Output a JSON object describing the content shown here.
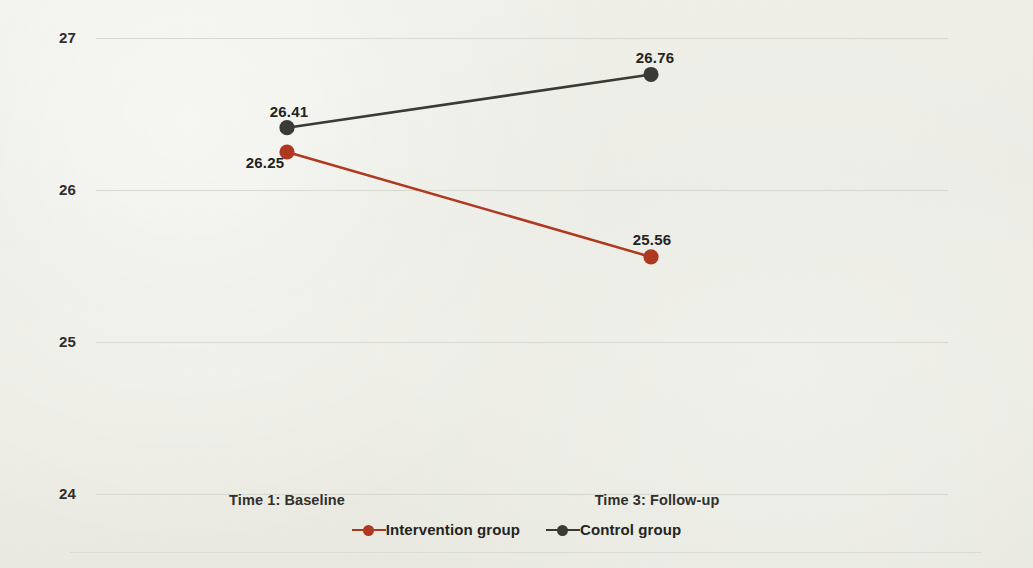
{
  "chart_data": {
    "type": "line",
    "title": "",
    "subtitle": "",
    "xlabel": "",
    "ylabel": "",
    "categories": [
      "Time 1: Baseline",
      "Time 3: Follow-up"
    ],
    "yticks": [
      "27",
      "26",
      "25",
      "24"
    ],
    "ylim": [
      24,
      27
    ],
    "grid": true,
    "legend_position": "bottom-center",
    "series": [
      {
        "name": "Intervention group",
        "color": "#b0381f",
        "values": [
          26.25,
          25.56
        ],
        "labels": [
          "26.25",
          "25.56"
        ]
      },
      {
        "name": "Control group",
        "color": "#3a3a34",
        "values": [
          26.41,
          26.76
        ],
        "labels": [
          "26.41",
          "26.76"
        ]
      }
    ]
  },
  "colors": {
    "background": "#eeeee7",
    "gridline": "#d2d5cc",
    "text": "#232321",
    "intervention": "#b0381f",
    "control": "#3a3a34"
  }
}
